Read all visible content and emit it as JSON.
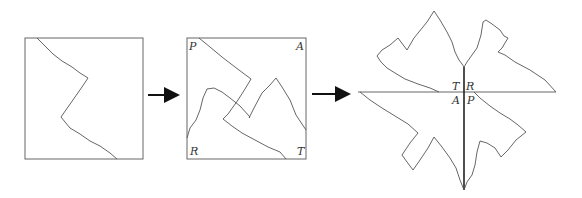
{
  "diagram": {
    "stage1": {
      "label": "original-square"
    },
    "stage2": {
      "corners": {
        "top_left": "P",
        "top_right": "A",
        "bottom_left": "R",
        "bottom_right": "T"
      }
    },
    "stage3": {
      "center_labels": {
        "upper_left": "T",
        "upper_right": "R",
        "lower_left": "A",
        "lower_right": "P"
      }
    },
    "colors": {
      "line": "#555555",
      "axis": "#222222",
      "arrow": "#111111"
    }
  }
}
